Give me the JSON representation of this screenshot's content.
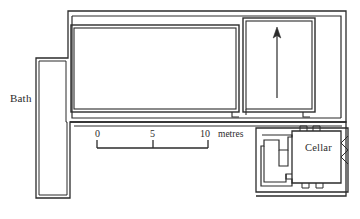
{
  "figure": {
    "type": "architectural-floor-plan",
    "background_color": "#ffffff",
    "line_color": "#2b2b2b"
  },
  "labels": {
    "bath": "Bath",
    "cellar": "Cellar"
  },
  "scale_bar": {
    "ticks": [
      "0",
      "5",
      "10"
    ],
    "unit": "metres",
    "unit_label": "10 metres",
    "start_x": 97,
    "end_x": 208,
    "mid_x": 153,
    "baseline_y": 148
  },
  "north_arrow": {
    "name": "north-arrow",
    "direction": "up",
    "x": 277,
    "tail_y": 98,
    "head_y": 30
  },
  "rooms": [
    {
      "name": "bath-wing",
      "label": "Bath"
    },
    {
      "name": "main-hall",
      "label": ""
    },
    {
      "name": "north-arrow-room",
      "label": ""
    },
    {
      "name": "cellar",
      "label": "Cellar"
    },
    {
      "name": "stepped-passage",
      "label": ""
    }
  ],
  "geometry": {
    "outer_wall": "M68,11 L346,11 L346,120 L70,120 L70,198 L36,198 L36,58 L68,58 Z",
    "upper_outer_inner": "M74,17 L340,17 L340,116",
    "main_hall_outer": "M72,28 L239,28 L239,113 L72,113 Z",
    "main_hall_inner": "M75,31 L236,31 L236,110 L75,110 Z",
    "arrow_room_outer": "M243,20 L314,20 L314,113 L243,113 Z",
    "arrow_room_inner": "M246,23 L311,23 L311,110 L246,110 Z",
    "lower_band_top": "M70,122 L346,122",
    "bath_wing": "M36,58 L68,58 L68,120 L70,120 L70,198 L36,198 Z",
    "cellar_block_outer": "M258,128 L348,128 L348,190 L258,190 Z",
    "cellar_room": "M293,132 L340,132 L340,182 L293,182 Z",
    "stepped_passage": "M262,136 L300,136 L300,152 L288,152 L288,142 L268,142 L268,178 L300,178 L300,170 L310,170 L310,178"
  }
}
